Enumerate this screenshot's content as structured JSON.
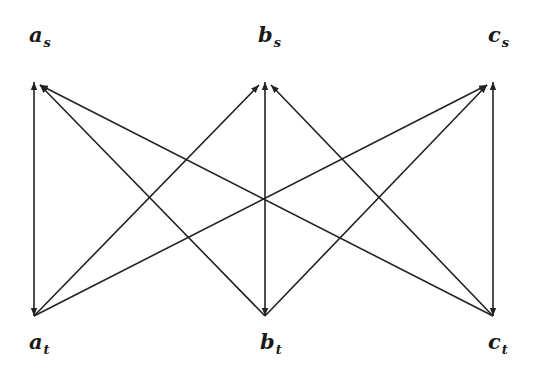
{
  "diagram": {
    "type": "directed-graph",
    "background": "#ffffff",
    "edge_color": "#222222",
    "nodes": [
      {
        "id": "a_s",
        "base": "a",
        "sub": "s",
        "row": "top",
        "x": 34,
        "y": 82,
        "label_x": 34,
        "label_y": 36
      },
      {
        "id": "b_s",
        "base": "b",
        "sub": "s",
        "row": "top",
        "x": 265,
        "y": 82,
        "label_x": 263,
        "label_y": 36
      },
      {
        "id": "c_s",
        "base": "c",
        "sub": "s",
        "row": "top",
        "x": 493,
        "y": 82,
        "label_x": 493,
        "label_y": 36
      },
      {
        "id": "a_t",
        "base": "a",
        "sub": "t",
        "row": "bottom",
        "x": 34,
        "y": 316,
        "label_x": 34,
        "label_y": 343
      },
      {
        "id": "b_t",
        "base": "b",
        "sub": "t",
        "row": "bottom",
        "x": 265,
        "y": 316,
        "label_x": 265,
        "label_y": 343
      },
      {
        "id": "c_t",
        "base": "c",
        "sub": "t",
        "row": "bottom",
        "x": 493,
        "y": 316,
        "label_x": 493,
        "label_y": 343
      }
    ],
    "edges": [
      {
        "from": "a_t",
        "to": "a_s",
        "bidirectional": true
      },
      {
        "from": "b_t",
        "to": "b_s",
        "bidirectional": true
      },
      {
        "from": "c_t",
        "to": "c_s",
        "bidirectional": true
      },
      {
        "from": "a_t",
        "to": "b_s",
        "bidirectional": false
      },
      {
        "from": "a_t",
        "to": "c_s",
        "bidirectional": false
      },
      {
        "from": "b_t",
        "to": "a_s",
        "bidirectional": false
      },
      {
        "from": "b_t",
        "to": "c_s",
        "bidirectional": false
      },
      {
        "from": "c_t",
        "to": "a_s",
        "bidirectional": false
      },
      {
        "from": "c_t",
        "to": "b_s",
        "bidirectional": false
      }
    ]
  }
}
